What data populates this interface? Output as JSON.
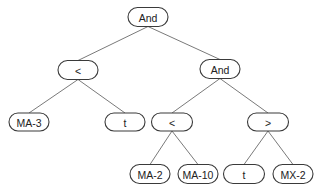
{
  "diagram": {
    "type": "expression-tree",
    "colors": {
      "background": "#ffffff",
      "node_border": "#3a3a3a",
      "edge": "#7a7a7a",
      "text": "#222222"
    },
    "nodes": [
      {
        "id": "n0",
        "label": "And",
        "cx": 148,
        "cy": 17,
        "w": 40,
        "h": 19
      },
      {
        "id": "n1",
        "label": "<",
        "cx": 78,
        "cy": 70,
        "w": 40,
        "h": 19
      },
      {
        "id": "n2",
        "label": "And",
        "cx": 220,
        "cy": 69,
        "w": 40,
        "h": 19
      },
      {
        "id": "n3",
        "label": "MA-3",
        "cx": 29,
        "cy": 122,
        "w": 40,
        "h": 18
      },
      {
        "id": "n4",
        "label": "t",
        "cx": 125,
        "cy": 122,
        "w": 40,
        "h": 18
      },
      {
        "id": "n5",
        "label": "<",
        "cx": 172,
        "cy": 122,
        "w": 41,
        "h": 18
      },
      {
        "id": "n6",
        "label": ">",
        "cx": 268,
        "cy": 122,
        "w": 41,
        "h": 18
      },
      {
        "id": "n7",
        "label": "MA-2",
        "cx": 150,
        "cy": 174,
        "w": 40,
        "h": 19
      },
      {
        "id": "n8",
        "label": "MA-10",
        "cx": 198,
        "cy": 174,
        "w": 40,
        "h": 19
      },
      {
        "id": "n9",
        "label": "t",
        "cx": 244,
        "cy": 174,
        "w": 41,
        "h": 19
      },
      {
        "id": "n10",
        "label": "MX-2",
        "cx": 293,
        "cy": 174,
        "w": 40,
        "h": 19
      }
    ],
    "edges": [
      {
        "from": "n0",
        "to": "n1"
      },
      {
        "from": "n0",
        "to": "n2"
      },
      {
        "from": "n1",
        "to": "n3"
      },
      {
        "from": "n1",
        "to": "n4"
      },
      {
        "from": "n2",
        "to": "n5"
      },
      {
        "from": "n2",
        "to": "n6"
      },
      {
        "from": "n5",
        "to": "n7"
      },
      {
        "from": "n5",
        "to": "n8"
      },
      {
        "from": "n6",
        "to": "n9"
      },
      {
        "from": "n6",
        "to": "n10"
      }
    ]
  }
}
